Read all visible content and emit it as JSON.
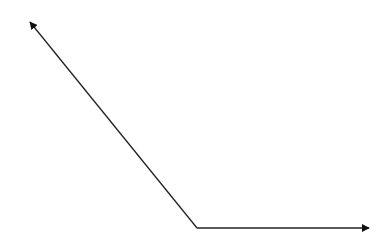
{
  "diagram": {
    "type": "angle",
    "stroke_color": "#222222",
    "stroke_width": 1.3,
    "vertex": {
      "x": 197,
      "y": 228
    },
    "rays": [
      {
        "name": "upper-left-ray",
        "to": {
          "x": 30,
          "y": 22
        }
      },
      {
        "name": "right-ray",
        "to": {
          "x": 369,
          "y": 228
        }
      }
    ]
  }
}
